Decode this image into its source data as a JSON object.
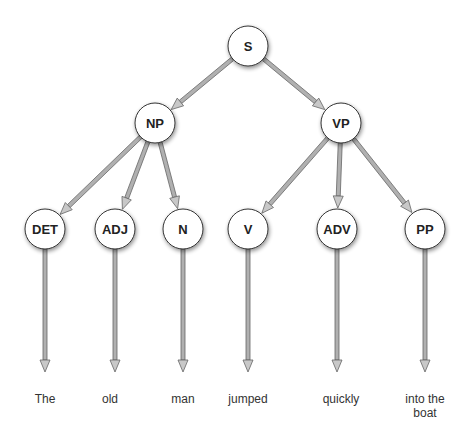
{
  "diagram": {
    "type": "parse-tree",
    "nodes": [
      {
        "id": "S",
        "label": "S",
        "x": 248,
        "y": 46
      },
      {
        "id": "NP",
        "label": "NP",
        "x": 155,
        "y": 123
      },
      {
        "id": "VP",
        "label": "VP",
        "x": 341,
        "y": 123
      },
      {
        "id": "DET",
        "label": "DET",
        "x": 45,
        "y": 229
      },
      {
        "id": "ADJ",
        "label": "ADJ",
        "x": 115,
        "y": 229
      },
      {
        "id": "N",
        "label": "N",
        "x": 183,
        "y": 229
      },
      {
        "id": "V",
        "label": "V",
        "x": 248,
        "y": 229
      },
      {
        "id": "ADV",
        "label": "ADV",
        "x": 337,
        "y": 229
      },
      {
        "id": "PP",
        "label": "PP",
        "x": 425,
        "y": 229
      }
    ],
    "edges": [
      {
        "from": "S",
        "to": "NP"
      },
      {
        "from": "S",
        "to": "VP"
      },
      {
        "from": "NP",
        "to": "DET"
      },
      {
        "from": "NP",
        "to": "ADJ"
      },
      {
        "from": "NP",
        "to": "N"
      },
      {
        "from": "VP",
        "to": "V"
      },
      {
        "from": "VP",
        "to": "ADV"
      },
      {
        "from": "VP",
        "to": "PP"
      }
    ],
    "words": [
      {
        "parent": "DET",
        "text": "The",
        "x": 45
      },
      {
        "parent": "ADJ",
        "text": "old",
        "x": 110
      },
      {
        "parent": "N",
        "text": "man",
        "x": 183
      },
      {
        "parent": "V",
        "text": "jumped",
        "x": 248
      },
      {
        "parent": "ADV",
        "text": "quickly",
        "x": 341
      },
      {
        "parent": "PP",
        "text": "into the boat",
        "line1": "into the",
        "line2": "boat",
        "x": 425
      }
    ],
    "node_radius": 20,
    "colors": {
      "node_fill": "#ffffff",
      "node_stroke": "#333333",
      "edge": "#888888",
      "edge_outline": "#666666",
      "text": "#222222"
    }
  }
}
